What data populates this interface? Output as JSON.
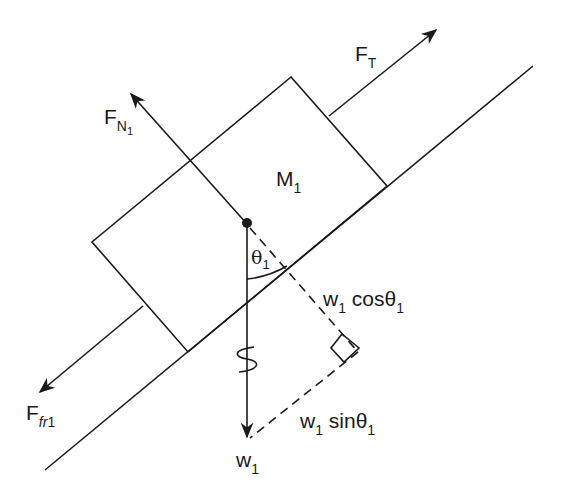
{
  "diagram": {
    "type": "free-body diagram",
    "colors": {
      "ink": "#1a1a1a",
      "background": "#ffffff"
    },
    "body": {
      "label": "M",
      "subscript": "1"
    },
    "forces": {
      "normal": {
        "label": "F",
        "subscript": "N",
        "subsub": "1"
      },
      "tension": {
        "label": "F",
        "subscript": "T"
      },
      "friction": {
        "label": "F",
        "subscript_italic": "fr",
        "subscript": "1"
      },
      "weight": {
        "label": "w",
        "subscript": "1"
      }
    },
    "angle": {
      "symbol": "θ",
      "subscript": "1"
    },
    "components": {
      "perpendicular": {
        "w": "w",
        "w_sub": "1",
        "func": " cosθ",
        "func_sub": "1"
      },
      "parallel": {
        "w": "w",
        "w_sub": "1",
        "func": " sinθ",
        "func_sub": "1"
      }
    }
  }
}
